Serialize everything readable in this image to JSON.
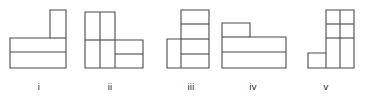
{
  "page": {
    "background_color": "#ffffff",
    "stroke_color": "#4a4a4a",
    "fill_color": "#ffffff",
    "width": 366,
    "height": 98
  },
  "figures": [
    {
      "id": "figure-i",
      "label": "i",
      "label_x": 39,
      "label_y": 82,
      "description": "Wide rectangle split into two horizontal rows with a tall narrow rectangle standing on its top right",
      "outline": "M 10 38 L 50 38 L 50 10 L 66 10 L 66 68 L 10 68 Z",
      "dividers": [
        {
          "x1": 10,
          "y1": 52,
          "x2": 66,
          "y2": 52
        },
        {
          "x1": 50,
          "y1": 38,
          "x2": 66,
          "y2": 38
        }
      ]
    },
    {
      "id": "figure-ii",
      "label": "ii",
      "label_x": 110,
      "label_y": 82,
      "description": "Two-column square block on the left with a wide two-row block attached at the bottom right",
      "outline": "M 85 12 L 115 12 L 115 40 L 143 40 L 143 68 L 85 68 Z",
      "dividers": [
        {
          "x1": 100,
          "y1": 12,
          "x2": 100,
          "y2": 68
        },
        {
          "x1": 85,
          "y1": 40,
          "x2": 115,
          "y2": 40
        },
        {
          "x1": 115,
          "y1": 40,
          "x2": 115,
          "y2": 68
        },
        {
          "x1": 115,
          "y1": 54,
          "x2": 143,
          "y2": 54
        }
      ]
    },
    {
      "id": "figure-iii",
      "label": "iii",
      "label_x": 191,
      "label_y": 82,
      "description": "Tall column divided into four horizontal rows with one square attached at the lower left",
      "outline": "M 181 10 L 209 10 L 209 68 L 167 68 L 167 39 L 181 39 Z",
      "dividers": [
        {
          "x1": 181,
          "y1": 24,
          "x2": 209,
          "y2": 24
        },
        {
          "x1": 181,
          "y1": 39,
          "x2": 209,
          "y2": 39
        },
        {
          "x1": 181,
          "y1": 54,
          "x2": 209,
          "y2": 54
        },
        {
          "x1": 181,
          "y1": 39,
          "x2": 181,
          "y2": 68
        }
      ]
    },
    {
      "id": "figure-iv",
      "label": "iv",
      "label_x": 253,
      "label_y": 82,
      "description": "Wide rectangle split into two horizontal rows with a smaller rectangle sitting on its top left",
      "outline": "M 222 23 L 250 23 L 250 37 L 286 37 L 286 68 L 222 68 Z",
      "dividers": [
        {
          "x1": 222,
          "y1": 37,
          "x2": 250,
          "y2": 37
        },
        {
          "x1": 222,
          "y1": 52,
          "x2": 286,
          "y2": 52
        }
      ]
    },
    {
      "id": "figure-v",
      "label": "v",
      "label_x": 326,
      "label_y": 82,
      "description": "Tall two-column stack with horizontal dividers and a wide rectangle attached at the bottom left",
      "outline": "M 326 10 L 354 10 L 354 68 L 308 68 L 308 53 L 326 53 Z",
      "dividers": [
        {
          "x1": 340,
          "y1": 10,
          "x2": 340,
          "y2": 68
        },
        {
          "x1": 326,
          "y1": 24,
          "x2": 354,
          "y2": 24
        },
        {
          "x1": 326,
          "y1": 38,
          "x2": 354,
          "y2": 38
        },
        {
          "x1": 326,
          "y1": 53,
          "x2": 326,
          "y2": 68
        }
      ]
    }
  ]
}
